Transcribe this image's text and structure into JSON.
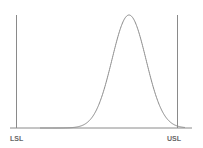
{
  "chart_data": {
    "type": "line",
    "title": "",
    "xlabel": "",
    "ylabel": "",
    "spec_limits": {
      "lower": {
        "label": "LSL",
        "x_px": 16
      },
      "upper": {
        "label": "USL",
        "x_px": 177
      }
    },
    "distribution": {
      "shape": "normal",
      "mean_px": 129,
      "sigma_px": 17,
      "peak_y_px": 15,
      "baseline_y_px": 128
    },
    "grid": false,
    "legend": null,
    "colors": {
      "curve": "#8a8a8a",
      "limits": "#8a8a8a",
      "baseline": "#8a8a8a",
      "labels": "#666666"
    }
  },
  "labels": {
    "lsl": "LSL",
    "usl": "USL"
  }
}
